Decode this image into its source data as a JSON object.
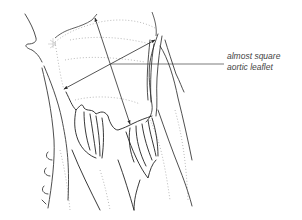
{
  "figure": {
    "type": "anatomical line illustration",
    "colors": {
      "ink": "#2a2a2a",
      "stipple": "#9a9a9a",
      "label": "#444444"
    }
  },
  "annotations": [
    {
      "id": "almost-square-aortic-leaflet",
      "lines": [
        "almost square",
        "aortic leaflet"
      ],
      "leader": {
        "from": [
          111,
          64
        ],
        "to": [
          224,
          64
        ]
      }
    }
  ],
  "measurements": [
    {
      "name": "leaflet-height-arrow",
      "from": [
        130,
        124
      ],
      "to": [
        95,
        18
      ],
      "double_headed": true
    },
    {
      "name": "leaflet-width-arrow",
      "from": [
        64,
        89
      ],
      "to": [
        155,
        40
      ],
      "double_headed": true
    }
  ]
}
